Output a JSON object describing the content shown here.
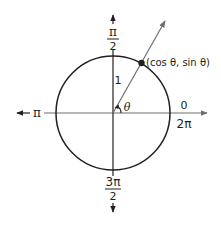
{
  "diagram": {
    "type": "unit-circle",
    "colors": {
      "circle": "#231f20",
      "axes": "#6d6e71",
      "ray": "#6d6e71",
      "point": "#231f20",
      "text": "#231f20",
      "background": "#ffffff"
    },
    "labels": {
      "top": {
        "numerator": "π",
        "denominator": "2"
      },
      "bottom": {
        "numerator": "3π",
        "denominator": "2"
      },
      "left": "π",
      "right_top": "0",
      "right_bottom": "2π",
      "radius": "1",
      "angle": "θ",
      "point": "(cos θ, sin θ)"
    },
    "geometry": {
      "center": [
        113,
        113
      ],
      "radius": 57,
      "ray_angle_deg": 60
    }
  }
}
